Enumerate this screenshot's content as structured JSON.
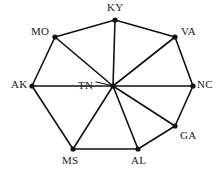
{
  "diagram": {
    "type": "wheel-graph",
    "background_color": "#ffffff",
    "edge_color": "#111111",
    "node_color": "#111111",
    "label_color": "#1a1a1a",
    "edge_width": 1.6,
    "node_radius": 2.6,
    "hub": {
      "id": "TN",
      "label": "TN",
      "x": 113,
      "y": 86,
      "label_x": 78,
      "label_y": 80,
      "leader_line": {
        "x1": 96,
        "y1": 82,
        "x2": 110,
        "y2": 85
      }
    },
    "nodes": [
      {
        "id": "KY",
        "label": "KY",
        "x": 115,
        "y": 20,
        "label_x": 107,
        "label_y": 2
      },
      {
        "id": "VA",
        "label": "VA",
        "x": 175,
        "y": 37,
        "label_x": 181,
        "label_y": 26
      },
      {
        "id": "NC",
        "label": "NC",
        "x": 193,
        "y": 86,
        "label_x": 197,
        "label_y": 79
      },
      {
        "id": "GA",
        "label": "GA",
        "x": 175,
        "y": 126,
        "label_x": 180,
        "label_y": 130
      },
      {
        "id": "AL",
        "label": "AL",
        "x": 138,
        "y": 149,
        "label_x": 131,
        "label_y": 155
      },
      {
        "id": "MS",
        "label": "MS",
        "x": 73,
        "y": 149,
        "label_x": 62,
        "label_y": 155
      },
      {
        "id": "AK",
        "label": "AK",
        "x": 32,
        "y": 86,
        "label_x": 11,
        "label_y": 79
      },
      {
        "id": "MO",
        "label": "MO",
        "x": 55,
        "y": 37,
        "label_x": 31,
        "label_y": 26
      }
    ],
    "spoke_edges": [
      {
        "from": "TN",
        "to": "KY"
      },
      {
        "from": "TN",
        "to": "VA"
      },
      {
        "from": "TN",
        "to": "NC"
      },
      {
        "from": "TN",
        "to": "GA"
      },
      {
        "from": "TN",
        "to": "AL"
      },
      {
        "from": "TN",
        "to": "MS"
      },
      {
        "from": "TN",
        "to": "AK"
      },
      {
        "from": "TN",
        "to": "MO"
      }
    ],
    "rim_edges": [
      {
        "from": "KY",
        "to": "VA"
      },
      {
        "from": "VA",
        "to": "NC"
      },
      {
        "from": "NC",
        "to": "GA"
      },
      {
        "from": "GA",
        "to": "AL"
      },
      {
        "from": "AL",
        "to": "MS"
      },
      {
        "from": "MS",
        "to": "AK"
      },
      {
        "from": "AK",
        "to": "MO"
      },
      {
        "from": "MO",
        "to": "KY"
      }
    ]
  }
}
